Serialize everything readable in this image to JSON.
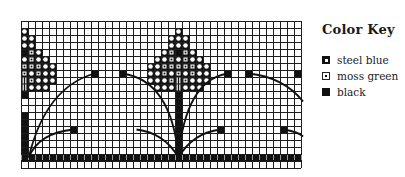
{
  "legend": {
    "title": "Color Key",
    "items": [
      {
        "label": "steel blue",
        "symbol": "dark-square-with-white-center"
      },
      {
        "label": "moss green",
        "symbol": "white-square-with-dot"
      },
      {
        "label": "black",
        "symbol": "solid-black-square"
      }
    ]
  },
  "grid": {
    "origin_x": 21,
    "origin_y": 21,
    "cell": 7,
    "cols": 40,
    "rows": 21,
    "line_color": "#1e1e1e",
    "fill_color": "#111111"
  },
  "motifs": {
    "trees": [
      {
        "name": "tree-left",
        "center_col": 0,
        "partial": true
      },
      {
        "name": "tree-center",
        "center_col": 22
      }
    ],
    "trunks": [
      {
        "col": 0,
        "from_row": 13,
        "to_row": 19
      },
      {
        "col": 22,
        "from_row": 11,
        "to_row": 19
      }
    ],
    "ground_row": 19,
    "branch_tips": [
      {
        "col": 10,
        "row": 7
      },
      {
        "col": 14,
        "row": 7
      },
      {
        "col": 7,
        "row": 15
      },
      {
        "col": 28,
        "row": 15
      },
      {
        "col": 29,
        "row": 7
      },
      {
        "col": 32,
        "row": 7
      },
      {
        "col": 37,
        "row": 15
      },
      {
        "col": 39,
        "row": 7
      }
    ]
  }
}
